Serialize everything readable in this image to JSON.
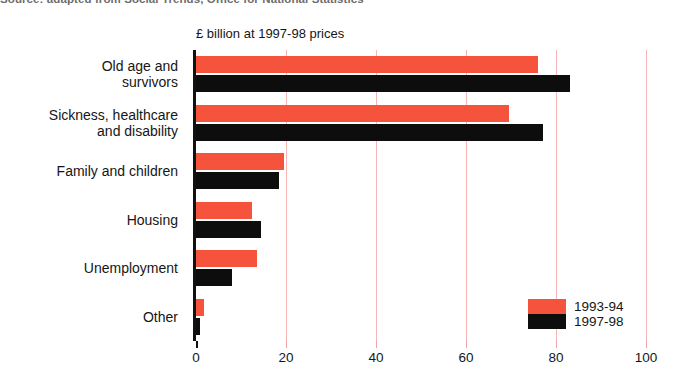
{
  "source_note": "Source: adapted from Social Trends, Office for National Statistics",
  "legend": {
    "position": "bottom-right",
    "entries": [
      {
        "label": "1993-94",
        "color": "#f5533c"
      },
      {
        "label": "1997-98",
        "color": "#0d0d0d"
      }
    ]
  },
  "chart_data": {
    "type": "bar",
    "orientation": "horizontal",
    "title": "",
    "subtitle": "",
    "axis_title": "£ billion at 1997-98 prices",
    "xlabel": "",
    "ylabel": "",
    "xlim": [
      0,
      100
    ],
    "xticks": [
      0,
      20,
      40,
      60,
      80,
      100
    ],
    "xtick_labels": [
      "0",
      "20",
      "40",
      "60",
      "80",
      "100"
    ],
    "grid": "vertical-only",
    "grid_color": "#f6b6b6",
    "categories": [
      "Old age and survivors",
      "Sickness, healthcare and disability",
      "Family and children",
      "Housing",
      "Unemployment",
      "Other"
    ],
    "category_lines": [
      [
        "Old age and",
        "survivors"
      ],
      [
        "Sickness, healthcare",
        "and disability"
      ],
      [
        "Family and children"
      ],
      [
        "Housing"
      ],
      [
        "Unemployment"
      ],
      [
        "Other"
      ]
    ],
    "series": [
      {
        "name": "1993-94",
        "color": "#f5533c",
        "values": [
          76,
          69.5,
          19.5,
          12.5,
          13.5,
          1.8
        ]
      },
      {
        "name": "1997-98",
        "color": "#0d0d0d",
        "values": [
          83,
          77,
          18.5,
          14.5,
          8,
          0.8
        ]
      }
    ]
  }
}
